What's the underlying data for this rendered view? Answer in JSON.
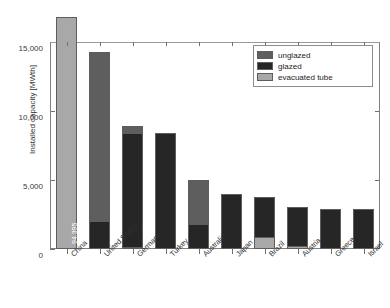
{
  "chart_data": {
    "type": "bar",
    "subtype": "stacked-vertical",
    "title": "",
    "xlabel": "",
    "ylabel": "Installed capacity [MWth]",
    "ylim": [
      0,
      16500
    ],
    "y_axis_display_max": 15000,
    "yticks": [
      0,
      5000,
      10000,
      15000
    ],
    "ytick_labels": [
      "0",
      "5,000",
      "10,000",
      "15,000"
    ],
    "grid": false,
    "legend_position": "top-right",
    "categories": [
      "China",
      "United States",
      "Germany",
      "Turkey",
      "Australia",
      "Japan",
      "Brazil",
      "Austria",
      "Greece",
      "Israel"
    ],
    "stack_order_bottom_to_top": [
      "evacuated tube",
      "glazed",
      "unglazed"
    ],
    "series": [
      {
        "name": "evacuated tube",
        "color": "#a8a8a8",
        "values": [
          87290,
          0,
          180,
          0,
          0,
          0,
          900,
          250,
          0,
          0
        ]
      },
      {
        "name": "glazed",
        "color": "#262626",
        "values": [
          7105,
          2000,
          8220,
          8400,
          1800,
          3950,
          2850,
          2800,
          2900,
          2900
        ]
      },
      {
        "name": "unglazed",
        "color": "#5e5e5e",
        "values": [
          0,
          12300,
          500,
          0,
          3200,
          0,
          0,
          0,
          0,
          0
        ]
      }
    ],
    "totals": [
      94395,
      14300,
      8900,
      8400,
      5000,
      3950,
      3750,
      3050,
      2900,
      2900
    ],
    "annotations": [
      {
        "category": "China",
        "text": "94,395",
        "segment": "evacuated tube"
      },
      {
        "category": "China",
        "text": "7,105",
        "segment": "glazed"
      }
    ]
  },
  "legend": {
    "items": [
      {
        "label": "unglazed",
        "color": "#5e5e5e"
      },
      {
        "label": "glazed",
        "color": "#262626"
      },
      {
        "label": "evacuated tube",
        "color": "#a8a8a8"
      }
    ]
  },
  "colors": {
    "unglazed": "#5e5e5e",
    "glazed": "#262626",
    "evacuated_tube": "#a8a8a8",
    "axis": "#707070",
    "text": "#2e2e2e",
    "background": "#ffffff"
  }
}
